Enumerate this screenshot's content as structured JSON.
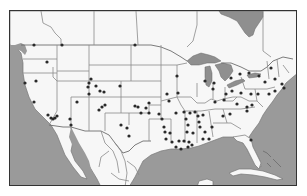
{
  "map": {
    "title": "",
    "regions": [
      "United States",
      "Canada",
      "Mexico",
      "Gulf of Mexico",
      "Great Lakes",
      "Cuba",
      "Bahamas"
    ],
    "colors": {
      "land": "#f7f7f7",
      "water": "#9a9a9a",
      "borders": "#8a8a8a",
      "frame": "#333333",
      "markers": "#2a2a2a"
    },
    "markers": [
      {
        "x": 33,
        "y": 44
      },
      {
        "x": 61,
        "y": 44
      },
      {
        "x": 134,
        "y": 44
      },
      {
        "x": 46,
        "y": 61
      },
      {
        "x": 35,
        "y": 80
      },
      {
        "x": 90,
        "y": 78
      },
      {
        "x": 88,
        "y": 82
      },
      {
        "x": 87,
        "y": 86
      },
      {
        "x": 95,
        "y": 85
      },
      {
        "x": 99,
        "y": 90
      },
      {
        "x": 103,
        "y": 91
      },
      {
        "x": 88,
        "y": 93
      },
      {
        "x": 119,
        "y": 85
      },
      {
        "x": 24,
        "y": 82
      },
      {
        "x": 33,
        "y": 101
      },
      {
        "x": 47,
        "y": 114
      },
      {
        "x": 50,
        "y": 117
      },
      {
        "x": 52,
        "y": 118
      },
      {
        "x": 54,
        "y": 117
      },
      {
        "x": 56,
        "y": 115
      },
      {
        "x": 69,
        "y": 118
      },
      {
        "x": 70,
        "y": 124
      },
      {
        "x": 76,
        "y": 101
      },
      {
        "x": 98,
        "y": 109
      },
      {
        "x": 101,
        "y": 106
      },
      {
        "x": 104,
        "y": 104
      },
      {
        "x": 120,
        "y": 124
      },
      {
        "x": 126,
        "y": 127
      },
      {
        "x": 128,
        "y": 135
      },
      {
        "x": 134,
        "y": 105
      },
      {
        "x": 137,
        "y": 106
      },
      {
        "x": 145,
        "y": 107
      },
      {
        "x": 140,
        "y": 112
      },
      {
        "x": 148,
        "y": 102
      },
      {
        "x": 148,
        "y": 112
      },
      {
        "x": 176,
        "y": 75
      },
      {
        "x": 166,
        "y": 93
      },
      {
        "x": 168,
        "y": 100
      },
      {
        "x": 177,
        "y": 92
      },
      {
        "x": 204,
        "y": 80
      },
      {
        "x": 213,
        "y": 82
      },
      {
        "x": 212,
        "y": 88
      },
      {
        "x": 158,
        "y": 113
      },
      {
        "x": 161,
        "y": 118
      },
      {
        "x": 163,
        "y": 126
      },
      {
        "x": 175,
        "y": 112
      },
      {
        "x": 189,
        "y": 112
      },
      {
        "x": 194,
        "y": 111
      },
      {
        "x": 202,
        "y": 114
      },
      {
        "x": 164,
        "y": 131
      },
      {
        "x": 169,
        "y": 132
      },
      {
        "x": 171,
        "y": 141
      },
      {
        "x": 165,
        "y": 138
      },
      {
        "x": 175,
        "y": 146
      },
      {
        "x": 180,
        "y": 148
      },
      {
        "x": 183,
        "y": 111
      },
      {
        "x": 185,
        "y": 118
      },
      {
        "x": 187,
        "y": 124
      },
      {
        "x": 186,
        "y": 131
      },
      {
        "x": 192,
        "y": 132
      },
      {
        "x": 197,
        "y": 115
      },
      {
        "x": 198,
        "y": 121
      },
      {
        "x": 199,
        "y": 126
      },
      {
        "x": 204,
        "y": 131
      },
      {
        "x": 202,
        "y": 138
      },
      {
        "x": 211,
        "y": 126
      },
      {
        "x": 208,
        "y": 138
      },
      {
        "x": 178,
        "y": 140
      },
      {
        "x": 183,
        "y": 140
      },
      {
        "x": 188,
        "y": 141
      },
      {
        "x": 191,
        "y": 144
      },
      {
        "x": 187,
        "y": 146
      },
      {
        "x": 230,
        "y": 77
      },
      {
        "x": 239,
        "y": 73
      },
      {
        "x": 248,
        "y": 72
      },
      {
        "x": 258,
        "y": 75
      },
      {
        "x": 270,
        "y": 67
      },
      {
        "x": 274,
        "y": 78
      },
      {
        "x": 281,
        "y": 83
      },
      {
        "x": 283,
        "y": 87
      },
      {
        "x": 264,
        "y": 81
      },
      {
        "x": 225,
        "y": 93
      },
      {
        "x": 231,
        "y": 90
      },
      {
        "x": 240,
        "y": 92
      },
      {
        "x": 250,
        "y": 93
      },
      {
        "x": 257,
        "y": 93
      },
      {
        "x": 268,
        "y": 93
      },
      {
        "x": 274,
        "y": 90
      },
      {
        "x": 214,
        "y": 101
      },
      {
        "x": 223,
        "y": 99
      },
      {
        "x": 236,
        "y": 103
      },
      {
        "x": 246,
        "y": 106
      },
      {
        "x": 251,
        "y": 104
      },
      {
        "x": 229,
        "y": 113
      },
      {
        "x": 222,
        "y": 115
      },
      {
        "x": 246,
        "y": 110
      },
      {
        "x": 250,
        "y": 139
      }
    ]
  }
}
